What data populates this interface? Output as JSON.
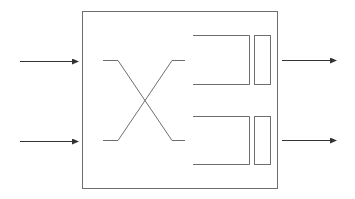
{
  "diagram": {
    "title": "",
    "colors": {
      "stroke": "#6e6e6e",
      "arrow": "#333333",
      "background": "#ffffff"
    },
    "inputs": [
      {
        "id": "input-1",
        "label": ""
      },
      {
        "id": "input-2",
        "label": ""
      }
    ],
    "outputs": [
      {
        "id": "output-1",
        "label": ""
      },
      {
        "id": "output-2",
        "label": ""
      }
    ],
    "components": {
      "switch_box": "outer-switch-box",
      "crossbar": "crossover-lines",
      "buffers": [
        "output-queue-1",
        "output-queue-2"
      ]
    }
  }
}
